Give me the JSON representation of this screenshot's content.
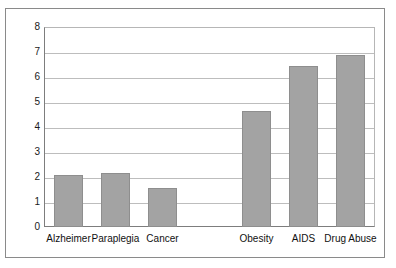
{
  "chart_data": {
    "type": "bar",
    "title": "",
    "subtitle": "",
    "xlabel": "",
    "ylabel": "",
    "categories": [
      "Alzheimer",
      "Paraplegia",
      "Cancer",
      "",
      "Obesity",
      "AIDS",
      "Drug Abuse"
    ],
    "values": [
      2.08,
      2.17,
      1.56,
      null,
      4.65,
      6.44,
      6.9
    ],
    "ylim": [
      0,
      8
    ],
    "yticks": [
      0,
      1,
      2,
      3,
      4,
      5,
      6,
      7,
      8
    ],
    "ytick_labels": [
      "0",
      "1",
      "2",
      "3",
      "4",
      "5",
      "6",
      "7",
      "8"
    ],
    "grid": true,
    "grid_axis": "y",
    "legend": false,
    "legend_position": "none",
    "bar_color": "#a3a3a3",
    "bar_border_color": "#8e8e8e",
    "gridline_color": "#bdbdbd",
    "axis_color": "#7d7d7d",
    "frame_color": "#8a8a8a",
    "background_color": "#ffffff",
    "annotations": []
  },
  "axes": {
    "y": {
      "ticks": [
        {
          "label": "8",
          "value": 8
        },
        {
          "label": "7",
          "value": 7
        },
        {
          "label": "6",
          "value": 6
        },
        {
          "label": "5",
          "value": 5
        },
        {
          "label": "4",
          "value": 4
        },
        {
          "label": "3",
          "value": 3
        },
        {
          "label": "2",
          "value": 2
        },
        {
          "label": "1",
          "value": 1
        },
        {
          "label": "0",
          "value": 0
        }
      ]
    },
    "x": {
      "ticks": [
        {
          "label": "Alzheimer"
        },
        {
          "label": "Paraplegia"
        },
        {
          "label": "Cancer"
        },
        {
          "label": ""
        },
        {
          "label": "Obesity"
        },
        {
          "label": "AIDS"
        },
        {
          "label": "Drug Abuse"
        }
      ]
    }
  }
}
